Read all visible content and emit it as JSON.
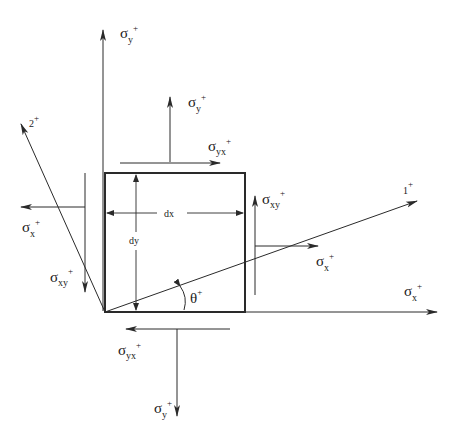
{
  "diagram": {
    "colors": {
      "line": "#2a2a2a",
      "text": "#1a1a1a",
      "background": "#ffffff"
    },
    "element": {
      "width_label": "dx",
      "height_label": "dy"
    },
    "angle": {
      "symbol": "θ",
      "sign": "+"
    },
    "axes": {
      "principal_1": {
        "label": "1",
        "sign": "+"
      },
      "principal_2": {
        "label": "2",
        "sign": "+"
      }
    },
    "stresses": {
      "sigma_y_axis": {
        "symbol": "σ",
        "sub": "y",
        "sign": "+"
      },
      "sigma_y_top": {
        "symbol": "σ",
        "sub": "y",
        "sign": "+"
      },
      "sigma_yx_top": {
        "symbol": "σ",
        "sub": "yx",
        "sign": "+"
      },
      "sigma_x_left": {
        "symbol": "σ",
        "sub": "x",
        "sign": "+"
      },
      "sigma_xy_left": {
        "symbol": "σ",
        "sub": "xy",
        "sign": "+"
      },
      "sigma_xy_right": {
        "symbol": "σ",
        "sub": "xy",
        "sign": "+"
      },
      "sigma_x_right": {
        "symbol": "σ",
        "sub": "x",
        "sign": "+"
      },
      "sigma_x_axis": {
        "symbol": "σ",
        "sub": "x",
        "sign": "+"
      },
      "sigma_yx_bottom": {
        "symbol": "σ",
        "sub": "yx",
        "sign": "+"
      },
      "sigma_y_bottom": {
        "symbol": "σ",
        "sub": "y",
        "sign": "+"
      }
    }
  }
}
